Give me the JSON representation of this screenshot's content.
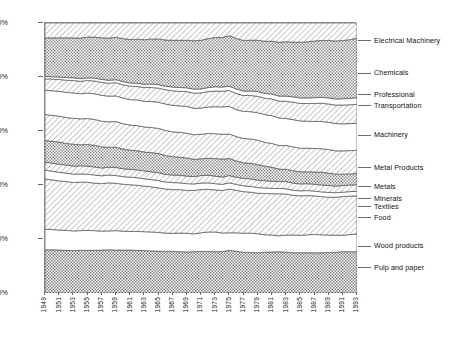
{
  "chart_data": {
    "type": "area",
    "title": "",
    "subtitle": "",
    "xlabel": "",
    "ylabel": "",
    "stacked": true,
    "stack_mode": "percent",
    "grid": false,
    "legend_position": "right",
    "ylim": [
      0,
      100
    ],
    "ytick_labels": [
      "0%",
      "20%",
      "40%",
      "60%",
      "80%",
      "100%"
    ],
    "ytick_values": [
      0,
      20,
      40,
      60,
      80,
      100
    ],
    "x": [
      1949,
      1950,
      1951,
      1952,
      1953,
      1954,
      1955,
      1956,
      1957,
      1958,
      1959,
      1960,
      1961,
      1962,
      1963,
      1964,
      1965,
      1966,
      1967,
      1968,
      1969,
      1970,
      1971,
      1972,
      1973,
      1974,
      1975,
      1976,
      1977,
      1978,
      1979,
      1980,
      1981,
      1982,
      1983,
      1984,
      1985,
      1986,
      1987,
      1988,
      1989,
      1990,
      1991,
      1992,
      1993
    ],
    "xtick_labels": [
      "1949",
      "1951",
      "1953",
      "1955",
      "1957",
      "1959",
      "1961",
      "1963",
      "1965",
      "1967",
      "1969",
      "1971",
      "1973",
      "1975",
      "1977",
      "1979",
      "1981",
      "1983",
      "1985",
      "1987",
      "1989",
      "1991",
      "1993"
    ],
    "xlim": [
      1949,
      1993
    ],
    "series": [
      {
        "name": "Pulp and paper",
        "pattern": "checker-dense",
        "values": [
          16.0,
          16.0,
          15.9,
          15.8,
          15.7,
          15.8,
          15.8,
          15.8,
          15.9,
          16.0,
          15.9,
          15.9,
          15.9,
          15.8,
          15.7,
          15.6,
          15.5,
          15.4,
          15.4,
          15.3,
          15.2,
          15.3,
          15.4,
          15.4,
          15.3,
          15.4,
          15.8,
          15.6,
          15.4,
          15.3,
          15.2,
          15.4,
          15.5,
          15.6,
          15.4,
          15.2,
          15.2,
          15.2,
          15.2,
          15.2,
          15.3,
          15.4,
          15.6,
          15.6,
          15.6
        ]
      },
      {
        "name": "Wood products",
        "pattern": "blank",
        "values": [
          7.6,
          7.5,
          7.4,
          7.4,
          7.3,
          7.3,
          7.4,
          7.3,
          7.0,
          7.0,
          7.2,
          7.0,
          6.9,
          7.0,
          7.0,
          7.0,
          6.9,
          6.8,
          6.7,
          6.9,
          6.9,
          6.6,
          6.9,
          7.2,
          7.3,
          6.9,
          6.5,
          6.9,
          7.2,
          7.3,
          7.2,
          6.6,
          6.4,
          6.0,
          6.5,
          6.7,
          6.6,
          6.8,
          6.9,
          6.8,
          6.6,
          6.4,
          6.2,
          6.5,
          6.7
        ]
      },
      {
        "name": "Food",
        "pattern": "hatch-light",
        "values": [
          18.6,
          18.4,
          18.2,
          18.1,
          17.9,
          18.0,
          17.8,
          17.6,
          17.6,
          17.8,
          17.5,
          17.4,
          17.3,
          17.1,
          16.9,
          16.7,
          16.5,
          16.3,
          16.2,
          16.1,
          15.9,
          16.1,
          16.0,
          15.8,
          15.6,
          15.8,
          16.2,
          15.9,
          15.7,
          15.5,
          15.3,
          15.6,
          15.6,
          15.9,
          15.5,
          15.0,
          14.9,
          14.8,
          14.6,
          14.4,
          14.3,
          14.4,
          14.6,
          14.5,
          14.4
        ]
      },
      {
        "name": "Textiles",
        "pattern": "blank",
        "values": [
          3.3,
          3.2,
          3.2,
          3.1,
          3.1,
          3.0,
          3.0,
          3.0,
          2.9,
          2.9,
          2.9,
          2.8,
          2.8,
          2.8,
          2.7,
          2.7,
          2.7,
          2.6,
          2.6,
          2.5,
          2.5,
          2.4,
          2.4,
          2.4,
          2.3,
          2.3,
          2.3,
          2.2,
          2.2,
          2.2,
          2.1,
          2.1,
          2.0,
          2.0,
          2.0,
          1.9,
          1.9,
          1.9,
          1.8,
          1.8,
          1.8,
          1.7,
          1.7,
          1.7,
          1.7
        ]
      },
      {
        "name": "Minerals",
        "pattern": "hatch-light",
        "values": [
          3.0,
          3.0,
          3.0,
          3.0,
          3.0,
          3.0,
          3.0,
          3.0,
          2.9,
          2.9,
          3.0,
          2.9,
          2.9,
          2.9,
          2.9,
          2.9,
          2.9,
          2.8,
          2.8,
          2.8,
          2.8,
          2.7,
          2.8,
          2.8,
          2.8,
          2.7,
          2.7,
          2.7,
          2.8,
          2.8,
          2.8,
          2.7,
          2.7,
          2.6,
          2.7,
          2.7,
          2.6,
          2.6,
          2.6,
          2.6,
          2.6,
          2.5,
          2.5,
          2.5,
          2.5
        ]
      },
      {
        "name": "Metals",
        "pattern": "checker-mid",
        "values": [
          8.0,
          8.1,
          8.2,
          8.0,
          8.1,
          7.8,
          8.0,
          8.0,
          7.8,
          7.4,
          7.5,
          7.3,
          7.1,
          7.1,
          7.0,
          7.1,
          7.1,
          7.0,
          6.8,
          6.7,
          6.7,
          6.4,
          6.2,
          6.3,
          6.5,
          6.7,
          6.3,
          6.1,
          5.9,
          5.9,
          5.9,
          5.5,
          5.3,
          4.7,
          4.6,
          4.7,
          4.6,
          4.5,
          4.6,
          4.8,
          4.7,
          4.5,
          4.3,
          4.2,
          4.2
        ]
      },
      {
        "name": "Metal Products",
        "pattern": "hatch-light",
        "values": [
          9.6,
          9.6,
          9.6,
          9.6,
          9.6,
          9.6,
          9.6,
          9.6,
          9.5,
          9.4,
          9.5,
          9.4,
          9.3,
          9.3,
          9.3,
          9.3,
          9.3,
          9.3,
          9.2,
          9.2,
          9.2,
          9.1,
          9.1,
          9.2,
          9.2,
          9.2,
          9.1,
          9.1,
          9.2,
          9.2,
          9.2,
          9.0,
          9.0,
          8.9,
          9.0,
          9.0,
          8.9,
          8.9,
          8.9,
          8.9,
          8.9,
          8.8,
          8.8,
          8.8,
          8.8
        ]
      },
      {
        "name": "Machinery",
        "pattern": "blank",
        "values": [
          9.0,
          9.1,
          9.2,
          9.3,
          9.4,
          9.3,
          9.4,
          9.5,
          9.6,
          9.5,
          9.5,
          9.5,
          9.4,
          9.5,
          9.5,
          9.6,
          9.7,
          9.8,
          9.8,
          9.8,
          9.9,
          9.8,
          9.7,
          9.8,
          10.0,
          10.2,
          10.2,
          10.1,
          10.2,
          10.3,
          10.4,
          10.5,
          10.5,
          10.4,
          10.2,
          10.3,
          10.3,
          10.2,
          10.2,
          10.3,
          10.3,
          10.3,
          10.2,
          10.2,
          10.2
        ]
      },
      {
        "name": "Transportation",
        "pattern": "hatch-light",
        "values": [
          4.2,
          4.3,
          4.4,
          4.5,
          4.6,
          4.6,
          4.7,
          4.7,
          4.8,
          4.8,
          4.9,
          4.9,
          5.0,
          5.0,
          5.1,
          5.2,
          5.2,
          5.3,
          5.4,
          5.4,
          5.5,
          5.6,
          5.6,
          5.7,
          5.8,
          5.8,
          5.9,
          6.0,
          6.0,
          6.1,
          6.2,
          6.2,
          6.3,
          6.4,
          6.5,
          6.6,
          6.6,
          6.7,
          6.8,
          6.9,
          6.9,
          7.0,
          7.1,
          7.1,
          7.2
        ]
      },
      {
        "name": "Professional",
        "pattern": "blank-thin",
        "values": [
          0.9,
          0.9,
          0.9,
          1.0,
          1.0,
          1.0,
          1.0,
          1.1,
          1.1,
          1.1,
          1.1,
          1.2,
          1.2,
          1.2,
          1.2,
          1.3,
          1.3,
          1.3,
          1.4,
          1.4,
          1.4,
          1.5,
          1.5,
          1.5,
          1.6,
          1.6,
          1.6,
          1.7,
          1.7,
          1.7,
          1.8,
          1.8,
          1.9,
          1.9,
          2.0,
          2.0,
          2.1,
          2.1,
          2.2,
          2.2,
          2.3,
          2.3,
          2.4,
          2.4,
          2.5
        ]
      },
      {
        "name": "Chemicals",
        "pattern": "checker-mid",
        "values": [
          14.3,
          14.4,
          14.5,
          14.7,
          14.8,
          15.0,
          15.1,
          15.2,
          15.4,
          15.6,
          15.7,
          15.9,
          16.1,
          16.3,
          16.5,
          16.7,
          16.9,
          17.1,
          17.3,
          17.5,
          17.6,
          17.9,
          18.0,
          18.1,
          18.2,
          18.4,
          18.7,
          18.9,
          19.1,
          19.2,
          19.4,
          19.7,
          19.9,
          20.3,
          20.5,
          20.7,
          21.0,
          21.2,
          21.4,
          21.5,
          21.7,
          21.9,
          22.0,
          22.2,
          22.4
        ]
      },
      {
        "name": "Electrical Machinery",
        "pattern": "hatch-light",
        "values": [
          5.5,
          5.5,
          5.5,
          5.5,
          5.5,
          5.6,
          5.2,
          5.2,
          5.5,
          5.6,
          5.3,
          5.8,
          6.1,
          6.0,
          6.2,
          5.9,
          5.9,
          6.3,
          6.4,
          6.4,
          6.4,
          6.6,
          6.4,
          5.8,
          5.4,
          5.4,
          4.7,
          5.8,
          6.6,
          6.5,
          6.5,
          6.9,
          6.9,
          7.3,
          7.1,
          7.2,
          7.3,
          7.1,
          6.8,
          6.6,
          6.6,
          6.8,
          6.6,
          6.3,
          5.8
        ]
      }
    ],
    "series_label_order_top_to_bottom": [
      "Electrical Machinery",
      "Chemicals",
      "Professional",
      "Transportation",
      "Machinery",
      "Metal Products",
      "Metals",
      "Minerals",
      "Textiles",
      "Food",
      "Wood products",
      "Pulp and paper"
    ],
    "label_y_percent": {
      "Electrical Machinery": 93.0,
      "Chemicals": 81.0,
      "Professional": 73.0,
      "Transportation": 69.0,
      "Machinery": 58.0,
      "Metal Products": 46.0,
      "Metals": 39.0,
      "Minerals": 34.5,
      "Textiles": 31.5,
      "Food": 27.5,
      "Wood products": 17.0,
      "Pulp and paper": 9.0
    },
    "colors": {
      "line": "#555555",
      "axis": "#8a8a8a",
      "text": "#111111",
      "fill_light": "#e8e8e8",
      "fill_mid": "#bdbdbd",
      "background": "#ffffff"
    }
  }
}
